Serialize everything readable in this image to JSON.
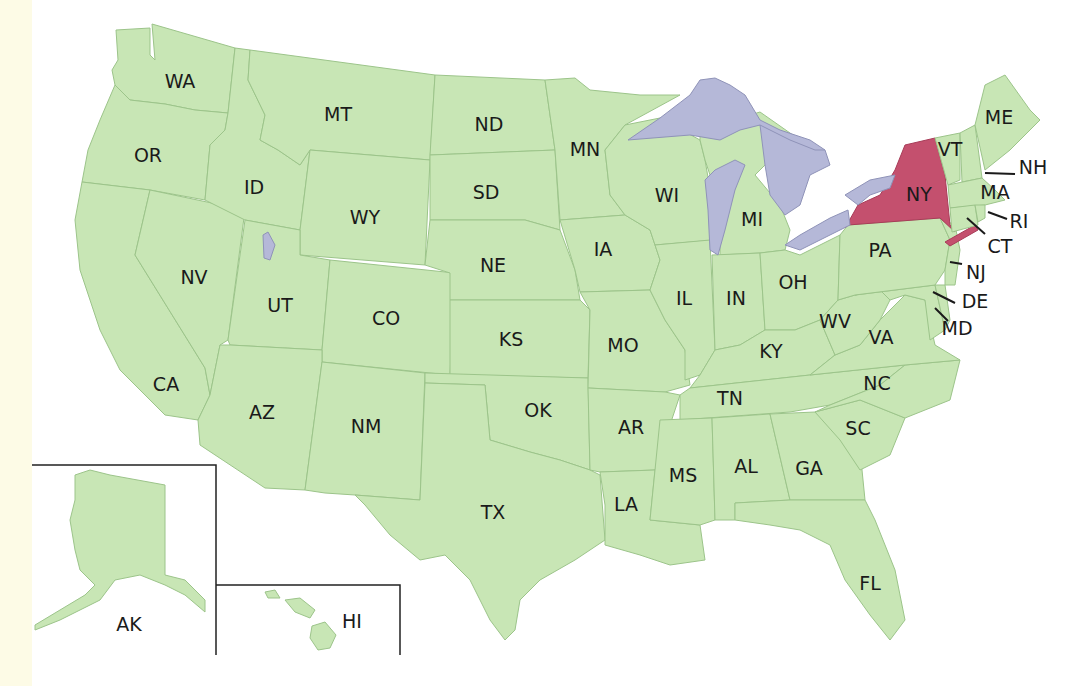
{
  "map": {
    "title": "",
    "highlighted_state": "NY",
    "colors": {
      "land": "#c8e6b5",
      "highlight": "#c4506e",
      "water": "#b5b8d8",
      "border": "#9cc48a",
      "label": "#1a1a1a"
    },
    "labels": {
      "WA": "WA",
      "OR": "OR",
      "CA": "CA",
      "ID": "ID",
      "NV": "NV",
      "MT": "MT",
      "WY": "WY",
      "UT": "UT",
      "AZ": "AZ",
      "CO": "CO",
      "NM": "NM",
      "ND": "ND",
      "SD": "SD",
      "NE": "NE",
      "KS": "KS",
      "OK": "OK",
      "TX": "TX",
      "MN": "MN",
      "IA": "IA",
      "MO": "MO",
      "AR": "AR",
      "LA": "LA",
      "WI": "WI",
      "IL": "IL",
      "MI": "MI",
      "IN": "IN",
      "OH": "OH",
      "KY": "KY",
      "TN": "TN",
      "MS": "MS",
      "AL": "AL",
      "GA": "GA",
      "FL": "FL",
      "SC": "SC",
      "NC": "NC",
      "VA": "VA",
      "WV": "WV",
      "PA": "PA",
      "NY": "NY",
      "VT": "VT",
      "NH": "NH",
      "ME": "ME",
      "MA": "MA",
      "RI": "RI",
      "CT": "CT",
      "NJ": "NJ",
      "DE": "DE",
      "MD": "MD",
      "AK": "AK",
      "HI": "HI"
    },
    "insets": [
      "AK",
      "HI"
    ]
  }
}
